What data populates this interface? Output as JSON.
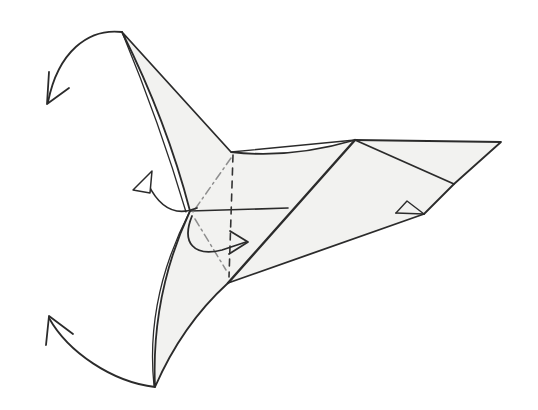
{
  "page": {
    "background": "#ffffff"
  },
  "palette": {
    "paper_fill": "#f2f2f0",
    "line_color": "#2b2b2b",
    "fold_line_gray": "#8f8f8f",
    "arrowhead_fill": "#ffffff"
  },
  "figure": {
    "viewbox": "0 0 538 410",
    "elements": [
      {
        "name": "paper-outline",
        "d": "M122,32 L231,152 Q290,159 355,140 L501,142 L454,184 L424,214 L228,283 Q182,325 155,387 Q151,295 190,211 Q167,122 122,32 Z",
        "fill": "#f2f2f0",
        "stroke": "#2b2b2b",
        "width": 1.8
      },
      {
        "name": "top-flap-layer-edge",
        "d": "M122,32 Q160,124 186,212",
        "fill": "none",
        "stroke": "#2b2b2b",
        "width": 1.3
      },
      {
        "name": "bottom-flap-layer-edge",
        "d": "M190,211 Q145,298 154,386",
        "fill": "none",
        "stroke": "#2b2b2b",
        "width": 1.3
      },
      {
        "name": "wing-top-layer-edge",
        "d": "M231,152 L355,140",
        "fill": "none",
        "stroke": "#2b2b2b",
        "width": 1.3
      },
      {
        "name": "body-ridge-line",
        "d": "M228,283 L355,140",
        "fill": "none",
        "stroke": "#2b2b2b",
        "width": 2.4
      },
      {
        "name": "center-horizontal-crease",
        "d": "M190,211 L288,208",
        "fill": "none",
        "stroke": "#2b2b2b",
        "width": 1.7
      },
      {
        "name": "wing-diagonal-crease",
        "d": "M355,140 L454,184",
        "fill": "none",
        "stroke": "#2b2b2b",
        "width": 1.7
      },
      {
        "name": "tail-bottom-edge",
        "d": "M424,214 L396,213",
        "fill": "none",
        "stroke": "#2b2b2b",
        "width": 1.7
      },
      {
        "name": "tail-tip-fold",
        "d": "M396,213 L407,201 L424,214",
        "fill": "none",
        "stroke": "#2b2b2b",
        "width": 1.4
      },
      {
        "name": "valley-fold-dashed-line",
        "d": "M233,155 L229,277",
        "fill": "none",
        "stroke": "#333333",
        "width": 1.6,
        "dash": "7,6"
      },
      {
        "name": "mountain-fold-upper",
        "d": "M231,158 L193,212",
        "fill": "none",
        "stroke": "#8f8f8f",
        "width": 1.5,
        "dash": "8,4,2,4"
      },
      {
        "name": "mountain-fold-lower",
        "d": "M195,219 L226,270",
        "fill": "none",
        "stroke": "#8f8f8f",
        "width": 1.5,
        "dash": "8,4,2,4"
      },
      {
        "name": "top-fold-arrow-arc",
        "d": "M122,32 C88,28 58,52 48,102",
        "fill": "none",
        "stroke": "#2b2b2b",
        "width": 1.8
      },
      {
        "name": "top-fold-arrow-head",
        "d": "M49,72 L47,104 L69,88",
        "fill": "none",
        "stroke": "#2b2b2b",
        "width": 1.8
      },
      {
        "name": "bottom-fold-arrow-arc",
        "d": "M155,387 C112,382 68,352 49,318",
        "fill": "none",
        "stroke": "#2b2b2b",
        "width": 1.8
      },
      {
        "name": "bottom-fold-arrow-head",
        "d": "M46,345 L49,316 L73,334",
        "fill": "none",
        "stroke": "#2b2b2b",
        "width": 1.8
      },
      {
        "name": "pullout-arrow-curve",
        "d": "M148,184 Q166,221 197,208",
        "fill": "none",
        "stroke": "#2b2b2b",
        "width": 1.7
      },
      {
        "name": "pullout-arrow-head",
        "d": "M133,190 L152,171 L150,193 Z",
        "fill": "#ffffff",
        "stroke": "#2b2b2b",
        "width": 1.5
      },
      {
        "name": "center-fold-arrow-curve",
        "d": "M192,216 C181,243 194,257 222,250 L246,242",
        "fill": "none",
        "stroke": "#2b2b2b",
        "width": 1.8
      },
      {
        "name": "center-fold-arrow-head",
        "d": "M230,231 L248,242 L229,254",
        "fill": "none",
        "stroke": "#2b2b2b",
        "width": 1.8
      }
    ]
  }
}
